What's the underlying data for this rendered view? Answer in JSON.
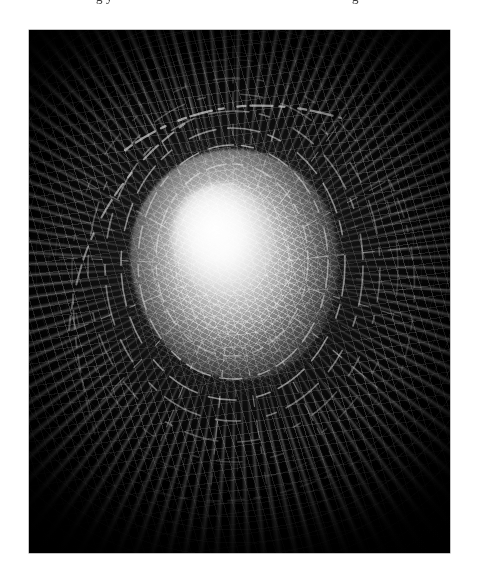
{
  "page": {
    "background_color": "#ffffff",
    "width_px": 479,
    "height_px": 571
  },
  "clipped_caption": {
    "note": "bottom sliver of a text line clipped by the top page edge; only descenders legible",
    "left_fragment": "g   y",
    "right_fragment": "g"
  },
  "figure": {
    "kind": "photograph",
    "subject_description": "Crumpled reflective foil-like surface photographed head-on with a bright central highlight",
    "palette": {
      "frame": "#000000",
      "background": "#000000",
      "highlight": "#ffffff",
      "midtone": "#9a9a9a",
      "shadow": "#0a0a0a",
      "border": "#8a8a8a"
    },
    "composition": {
      "plate_left_px": 29,
      "plate_top_px": 30,
      "plate_width_px": 421,
      "plate_height_px": 523,
      "core_center_x_pct": 49,
      "core_center_y_pct": 45,
      "core_width_px": 208,
      "core_height_px": 232,
      "structure": "radial",
      "vignette": "heavy, corners fully black"
    }
  }
}
